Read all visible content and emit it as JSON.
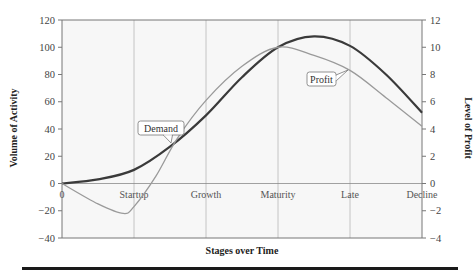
{
  "chart_data": {
    "type": "line",
    "title": "",
    "xlabel": "Stages over Time",
    "ylabel": "Volume of Activity",
    "y2label": "Level of Profit",
    "categories": [
      "0",
      "Startup",
      "Growth",
      "Maturity",
      "Late",
      "Decline"
    ],
    "ylim": [
      -40,
      120
    ],
    "y2lim": [
      -4,
      12
    ],
    "yticks": [
      -40,
      -20,
      0,
      20,
      40,
      60,
      80,
      100,
      120
    ],
    "y2ticks": [
      -4,
      -2,
      0,
      2,
      4,
      6,
      8,
      10,
      12
    ],
    "grid": "vertical",
    "series": [
      {
        "name": "Demand",
        "axis": "left",
        "color": "#3a3a3a",
        "x": [
          0,
          0.5,
          1,
          1.5,
          2,
          2.5,
          3,
          3.5,
          4,
          4.5,
          5
        ],
        "values": [
          0,
          3,
          10,
          27,
          50,
          78,
          100,
          108,
          101,
          80,
          52
        ]
      },
      {
        "name": "Profit",
        "axis": "right",
        "color": "#9a9a9a",
        "x": [
          0,
          0.5,
          0.85,
          1,
          1.3,
          1.6,
          2,
          2.5,
          3,
          3.5,
          4,
          4.5,
          5
        ],
        "values": [
          0,
          -1.5,
          -2.2,
          -1.7,
          0.5,
          3.3,
          6.1,
          8.6,
          10,
          9.4,
          8.3,
          6.3,
          4.2
        ]
      }
    ],
    "annotations": [
      {
        "text": "Demand",
        "target_series": "Demand"
      },
      {
        "text": "Profit",
        "target_series": "Profit"
      }
    ]
  }
}
